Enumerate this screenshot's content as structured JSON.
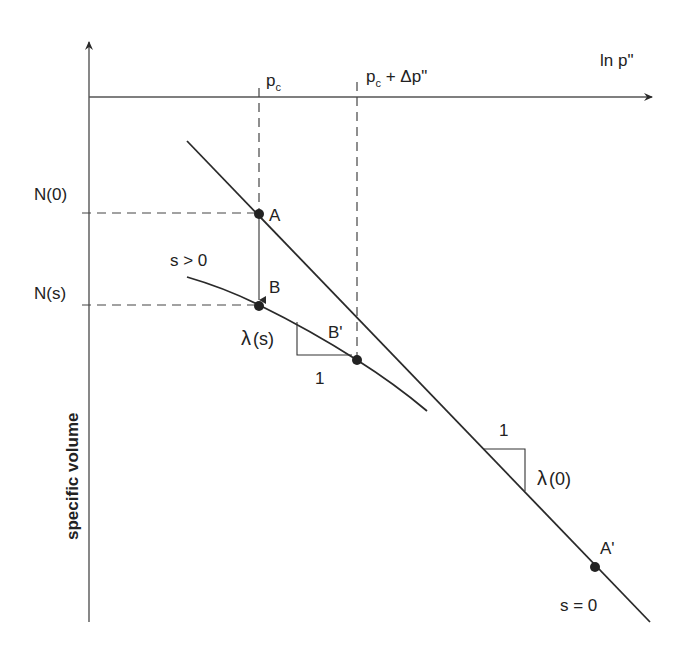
{
  "diagram": {
    "type": "compression-line-diagram",
    "colors": {
      "line": "#2a2a2a",
      "dash": "#444444",
      "background": "#ffffff"
    },
    "axes": {
      "x_label": "ln p\"",
      "y_label": "specific volume"
    },
    "pressure_marks": {
      "pc": {
        "base": "p",
        "sub": "c"
      },
      "pc_plus": {
        "base": "p",
        "sub": "c",
        "suffix": " + Δp\""
      }
    },
    "volume_marks": {
      "n0": "N(0)",
      "ns": "N(s)"
    },
    "points": {
      "A": "A",
      "B": "B",
      "B_prime": "B'",
      "A_prime": "A'"
    },
    "curves": {
      "unsaturated": "s > 0",
      "saturated": "s = 0"
    },
    "slopes": {
      "lambda_s": {
        "symbol": "λ",
        "arg": "(s)",
        "run": "1"
      },
      "lambda_0": {
        "symbol": "λ",
        "arg": "(0)",
        "run": "1"
      }
    }
  }
}
